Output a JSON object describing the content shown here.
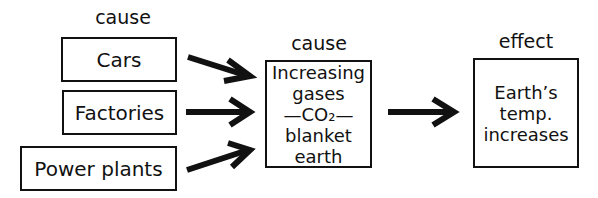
{
  "labels": {
    "cause_left": "cause",
    "cause_center": "cause",
    "effect": "effect"
  },
  "sources": [
    {
      "label": "Cars"
    },
    {
      "label": "Factories"
    },
    {
      "label": "Power plants"
    }
  ],
  "center": {
    "lines": [
      "Increasing",
      "gases",
      "—CO₂—",
      "blanket",
      "earth"
    ]
  },
  "effect_box": {
    "lines": [
      "Earth’s",
      "temp.",
      "increases"
    ]
  }
}
